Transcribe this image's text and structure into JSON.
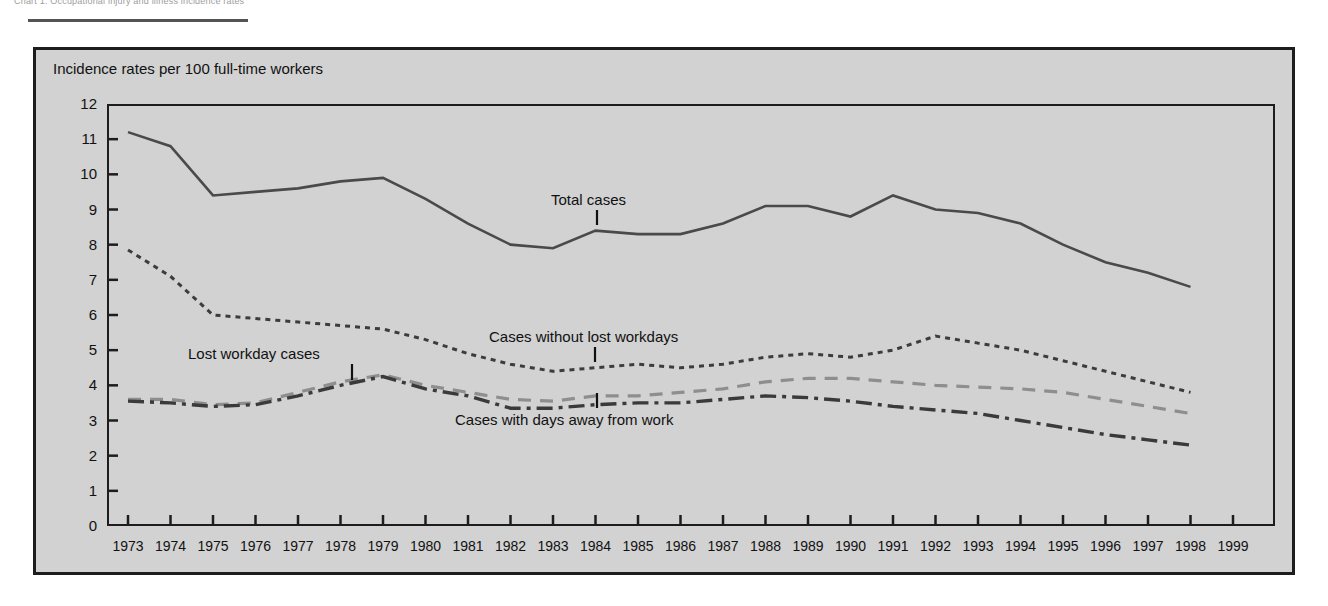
{
  "top_caption": "Chart 1.  Occupational injury and illness incidence rates",
  "figure": {
    "subtitle": "Incidence rates per 100 full-time workers"
  },
  "axes": {
    "y_ticks": [
      "12",
      "11",
      "10",
      "9",
      "8",
      "7",
      "6",
      "5",
      "4",
      "3",
      "2",
      "1",
      "0"
    ],
    "x_ticks": [
      "1973",
      "1974",
      "1975",
      "1976",
      "1977",
      "1978",
      "1979",
      "1980",
      "1981",
      "1982",
      "1983",
      "1984",
      "1985",
      "1986",
      "1987",
      "1988",
      "1989",
      "1990",
      "1991",
      "1992",
      "1993",
      "1994",
      "1995",
      "1996",
      "1997",
      "1998",
      "1999"
    ]
  },
  "annotations": {
    "total": "Total cases",
    "lost_workday": "Lost workday cases",
    "without_lost": "Cases without lost workdays",
    "days_away": "Cases with days away from work"
  },
  "colors": {
    "panel": "#d2d2d2",
    "frame": "#1d1d1d",
    "total_line": "#4a4a4a",
    "without_lost_line": "#3c3c3c",
    "lost_workday_line": "#8e8e8e",
    "days_away_line": "#3a3a3a",
    "text": "#111111"
  },
  "chart_data": {
    "type": "line",
    "title": "",
    "subtitle": "Incidence rates per 100 full-time workers",
    "xlabel": "",
    "ylabel": "Incidence rates per 100 full-time workers",
    "xlim": [
      1973,
      1999
    ],
    "ylim": [
      0,
      12
    ],
    "grid": false,
    "legend": "inline-annotations",
    "x": [
      1973,
      1974,
      1975,
      1976,
      1977,
      1978,
      1979,
      1980,
      1981,
      1982,
      1983,
      1984,
      1985,
      1986,
      1987,
      1988,
      1989,
      1990,
      1991,
      1992,
      1993,
      1994,
      1995,
      1996,
      1997,
      1998
    ],
    "series": [
      {
        "name": "Total cases",
        "style": "solid",
        "color": "#4a4a4a",
        "values": [
          11.2,
          10.8,
          9.4,
          9.5,
          9.6,
          9.8,
          9.9,
          9.3,
          8.6,
          8.0,
          7.9,
          8.4,
          8.3,
          8.3,
          8.6,
          9.1,
          9.1,
          8.8,
          9.4,
          9.0,
          8.9,
          8.6,
          8.0,
          7.5,
          7.2,
          6.8
        ]
      },
      {
        "name": "Cases without lost workdays",
        "style": "dotted",
        "color": "#3c3c3c",
        "values": [
          7.85,
          7.1,
          6.0,
          5.9,
          5.8,
          5.7,
          5.6,
          5.3,
          4.9,
          4.6,
          4.4,
          4.5,
          4.6,
          4.5,
          4.6,
          4.8,
          4.9,
          4.8,
          5.0,
          5.4,
          5.2,
          5.0,
          4.7,
          4.4,
          4.1,
          3.8
        ]
      },
      {
        "name": "Lost workday cases",
        "style": "dashed",
        "color": "#8e8e8e",
        "values": [
          3.6,
          3.6,
          3.45,
          3.5,
          3.8,
          4.1,
          4.3,
          4.0,
          3.8,
          3.6,
          3.55,
          3.7,
          3.7,
          3.8,
          3.9,
          4.1,
          4.2,
          4.2,
          4.1,
          4.0,
          3.95,
          3.9,
          3.8,
          3.6,
          3.4,
          3.2
        ]
      },
      {
        "name": "Cases with days away from work",
        "style": "dash-dot",
        "color": "#3a3a3a",
        "values": [
          3.55,
          3.5,
          3.4,
          3.45,
          3.7,
          4.0,
          4.25,
          3.9,
          3.7,
          3.35,
          3.35,
          3.45,
          3.5,
          3.5,
          3.6,
          3.7,
          3.65,
          3.55,
          3.4,
          3.3,
          3.2,
          3.0,
          2.8,
          2.6,
          2.45,
          2.3
        ]
      }
    ]
  }
}
